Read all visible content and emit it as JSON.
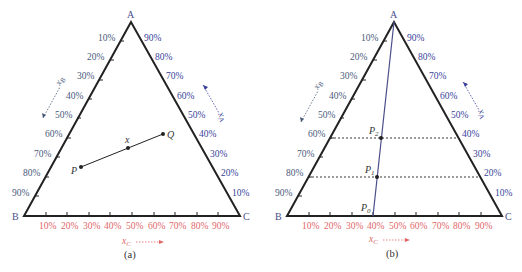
{
  "panels": [
    {
      "id": "a",
      "caption": "(a)",
      "vertices": {
        "top": "A",
        "left": "B",
        "right": "C"
      },
      "left_ticks": [
        "10%",
        "20%",
        "30%",
        "40%",
        "50%",
        "60%",
        "70%",
        "80%",
        "90%"
      ],
      "right_ticks": [
        "90%",
        "80%",
        "70%",
        "60%",
        "50%",
        "40%",
        "30%",
        "20%",
        "10%"
      ],
      "bottom_ticks": [
        "10%",
        "20%",
        "30%",
        "40%",
        "50%",
        "60%",
        "70%",
        "80%",
        "90%"
      ],
      "axis_labels": {
        "left": "x_B",
        "right": "x_A",
        "bottom": "x_C"
      },
      "points": {
        "P": "P",
        "x": "x",
        "Q": "Q"
      }
    },
    {
      "id": "b",
      "caption": "(b)",
      "vertices": {
        "top": "A",
        "left": "B",
        "right": "C"
      },
      "left_ticks": [
        "10%",
        "20%",
        "30%",
        "40%",
        "50%",
        "60%",
        "70%",
        "80%",
        "90%"
      ],
      "right_ticks": [
        "90%",
        "80%",
        "70%",
        "60%",
        "50%",
        "40%",
        "30%",
        "20%",
        "10%"
      ],
      "bottom_ticks": [
        "10%",
        "20%",
        "30%",
        "40%",
        "50%",
        "60%",
        "70%",
        "80%",
        "90%"
      ],
      "axis_labels": {
        "left": "x_B",
        "right": "x_A",
        "bottom": "x_C"
      },
      "points": {
        "P0": "P",
        "P0_sub": "0",
        "P1": "P",
        "P1_sub": "1",
        "P2": "P",
        "P2_sub": "2"
      }
    }
  ],
  "colors": {
    "left_ticks": "#4a5a7a",
    "right_ticks": "#3a3f9a",
    "bottom_ticks": "#e06868",
    "triangle": "#222222",
    "line_b": "#4a4f8a"
  }
}
